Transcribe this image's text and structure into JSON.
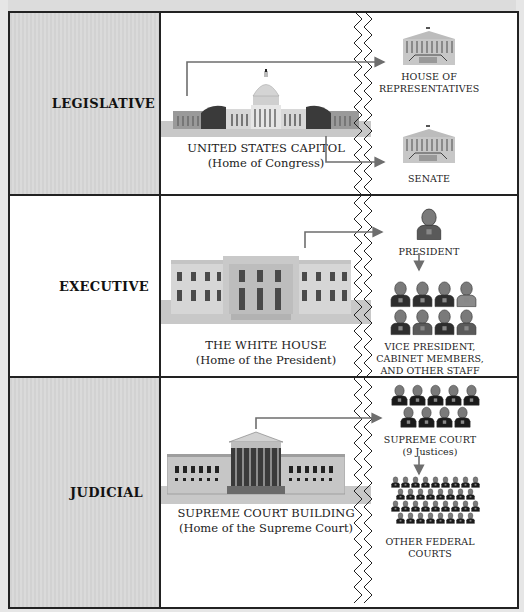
{
  "title": {
    "text": "",
    "note": "truncated at top edge"
  },
  "colors": {
    "border": "#222222",
    "shaded_cell": "#d6d6d6",
    "connector": "#6e6e6e",
    "ground": "#c8c8c8",
    "person_dark": "#2e2e2e",
    "person_mid": "#5a5a5a",
    "person_head": "#7a7a7a"
  },
  "rows": [
    {
      "branch": "LEGISLATIVE",
      "building": {
        "name": "UNITED STATES CAPITOL",
        "subtitle": "(Home of Congress)",
        "icon": "capitol-icon"
      },
      "bodies": [
        {
          "label_lines": [
            "HOUSE OF",
            "REPRESENTATIVES"
          ],
          "icon": "house-chamber-icon"
        },
        {
          "label_lines": [
            "SENATE"
          ],
          "icon": "senate-chamber-icon"
        }
      ]
    },
    {
      "branch": "EXECUTIVE",
      "building": {
        "name": "THE WHITE HOUSE",
        "subtitle": "(Home of the President)",
        "icon": "white-house-icon"
      },
      "bodies": [
        {
          "label_lines": [
            "PRESIDENT"
          ],
          "icon": "person-icon",
          "count": 1
        },
        {
          "label_lines": [
            "VICE PRESIDENT,",
            "CABINET MEMBERS,",
            "AND OTHER STAFF"
          ],
          "icon": "people-group-icon",
          "count": 8
        }
      ]
    },
    {
      "branch": "JUDICIAL",
      "building": {
        "name": "SUPREME COURT BUILDING",
        "subtitle": "(Home of the Supreme Court)",
        "icon": "supreme-court-icon"
      },
      "bodies": [
        {
          "label_lines": [
            "SUPREME COURT",
            "(9 Justices)"
          ],
          "icon": "justices-group-icon",
          "count": 9
        },
        {
          "label_lines": [
            "OTHER FEDERAL",
            "COURTS"
          ],
          "icon": "judges-group-icon",
          "count": 34
        }
      ]
    }
  ]
}
